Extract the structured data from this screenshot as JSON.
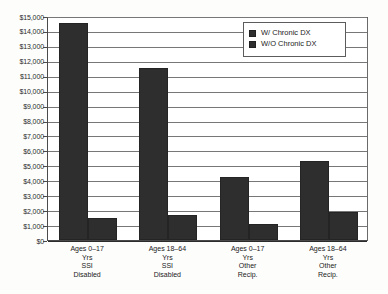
{
  "chart_data": {
    "type": "bar",
    "title": "",
    "subtitle": "",
    "xlabel": "",
    "ylabel": "",
    "ylim": [
      0,
      15000
    ],
    "grid": true,
    "legend_position": "top-right",
    "categories": [
      "Ages 0–17 Yrs SSI Disabled",
      "Ages 18–64 Yrs SSI Disabled",
      "Ages 0–17 Yrs Other Recip.",
      "Ages 18–64 Yrs Other Recip."
    ],
    "category_lines": [
      [
        "Ages 0–17",
        "Yrs",
        "SSI",
        "Disabled"
      ],
      [
        "Ages 18–64",
        "Yrs",
        "SSI",
        "Disabled"
      ],
      [
        "Ages 0–17",
        "Yrs",
        "Other",
        "Recip."
      ],
      [
        "Ages 18–64",
        "Yrs",
        "Other",
        "Recip."
      ]
    ],
    "series": [
      {
        "name": "W/ Chronic DX",
        "values": [
          14550,
          11550,
          4250,
          5300
        ],
        "color": "#2e2e2e"
      },
      {
        "name": "W/O Chronic DX",
        "values": [
          1480,
          1700,
          1100,
          1900
        ],
        "color": "#2e2e2e"
      }
    ],
    "y_ticks": [
      {
        "value": 15000,
        "label": "$15,000"
      },
      {
        "value": 14000,
        "label": "$14,000"
      },
      {
        "value": 13000,
        "label": "$13,000"
      },
      {
        "value": 12000,
        "label": "$12,000"
      },
      {
        "value": 11000,
        "label": "$11,000"
      },
      {
        "value": 10000,
        "label": "$10,000"
      },
      {
        "value": 9000,
        "label": "$9,000"
      },
      {
        "value": 8000,
        "label": "$8,000"
      },
      {
        "value": 7000,
        "label": "$7,000"
      },
      {
        "value": 6000,
        "label": "$6,000"
      },
      {
        "value": 5000,
        "label": "$5,000"
      },
      {
        "value": 4000,
        "label": "$4,000"
      },
      {
        "value": 3000,
        "label": "$3,000"
      },
      {
        "value": 2000,
        "label": "$2,000"
      },
      {
        "value": 1000,
        "label": "$1,000"
      },
      {
        "value": 0,
        "label": "$0"
      }
    ]
  },
  "legend": {
    "items": [
      {
        "label": "W/ Chronic DX"
      },
      {
        "label": "W/O Chronic DX"
      }
    ]
  },
  "colors": {
    "bar": "#2e2e2e",
    "grid": "#777777",
    "axis": "#2b2b2b",
    "background": "#fdfdfc"
  }
}
